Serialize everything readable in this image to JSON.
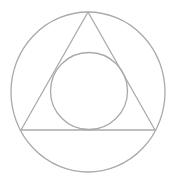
{
  "diagram": {
    "width": 175,
    "height": 183,
    "background": "#ffffff",
    "stroke_color": "#aaaaaa",
    "stroke_width": 1.3,
    "shapes": {
      "outer_circle": {
        "cx": 88,
        "cy": 92,
        "rx": 77,
        "ry": 80
      },
      "triangle": {
        "points": [
          [
            88,
            12
          ],
          [
            21,
            130
          ],
          [
            155,
            130
          ]
        ]
      },
      "inner_circle": {
        "cx": 89,
        "cy": 91,
        "r": 38.5
      }
    }
  }
}
